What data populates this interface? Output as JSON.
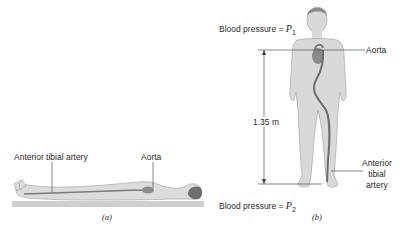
{
  "panel_a": {
    "caption": "(a)",
    "labels": {
      "anterior_tibial_artery": "Anterior tibial artery",
      "aorta": "Aorta"
    }
  },
  "panel_b": {
    "caption": "(b)",
    "labels": {
      "blood_pressure_top_prefix": "Blood pressure = ",
      "p1_symbol": "P",
      "p1_subscript": "1",
      "blood_pressure_bottom_prefix": "Blood pressure = ",
      "p2_symbol": "P",
      "p2_subscript": "2",
      "aorta": "Aorta",
      "height": "1.35 m",
      "anterior_tibial_artery_line1": "Anterior",
      "anterior_tibial_artery_line2": "tibial",
      "anterior_tibial_artery_line3": "artery"
    }
  },
  "colors": {
    "body_fill": "#d9d9d9",
    "body_stroke": "#a8a8a8",
    "artery": "#707070",
    "heart": "#8a8a8a",
    "hair": "#6e6e6e",
    "table": "#cfcfcf",
    "lines": "#3a3a3a"
  }
}
